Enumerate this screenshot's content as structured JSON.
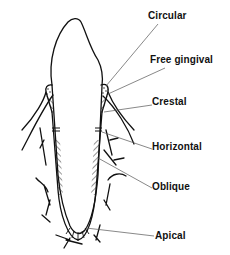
{
  "diagram": {
    "labels": [
      {
        "id": "circular",
        "text": "Circular",
        "x": 148,
        "y": 11
      },
      {
        "id": "free-gingival",
        "text": "Free gingival",
        "x": 150,
        "y": 55
      },
      {
        "id": "crestal",
        "text": "Crestal",
        "x": 152,
        "y": 97
      },
      {
        "id": "horizontal",
        "text": "Horizontal",
        "x": 152,
        "y": 142
      },
      {
        "id": "oblique",
        "text": "Oblique",
        "x": 152,
        "y": 182
      },
      {
        "id": "apical",
        "text": "Apical",
        "x": 155,
        "y": 231
      }
    ],
    "colors": {
      "line": "#111111",
      "background": "#ffffff"
    }
  }
}
